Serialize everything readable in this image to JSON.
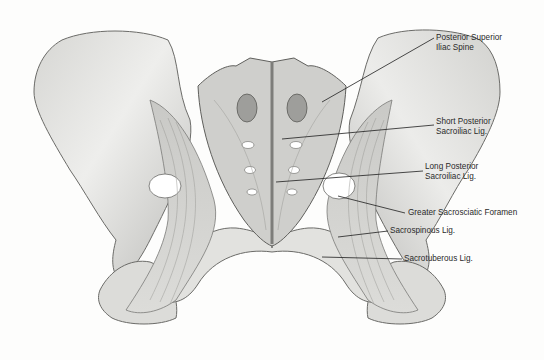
{
  "figure": {
    "colors": {
      "background": "#fdfdfc",
      "bone": "#e4e4e2",
      "bone_shadow": "#b9b9b6",
      "outline": "#6b6b68",
      "leader": "#1e1e1e",
      "label_text": "#2a2a2a"
    }
  },
  "labels": [
    {
      "id": "psis",
      "line1": "Posterior Superior",
      "line2": "Iliac Spine",
      "x": 436,
      "y": 33,
      "pointer": [
        [
          322,
          102
        ],
        [
          434,
          38
        ]
      ]
    },
    {
      "id": "short-posterior",
      "line1": "Short Posterior",
      "line2": "Sacroiliac Lig.",
      "x": 436,
      "y": 117,
      "pointer": [
        [
          282,
          139
        ],
        [
          434,
          125
        ]
      ]
    },
    {
      "id": "long-posterior",
      "line1": "Long Posterior",
      "line2": "Sacroiliac Lig.",
      "x": 425,
      "y": 162,
      "pointer": [
        [
          276,
          182
        ],
        [
          423,
          171
        ]
      ]
    },
    {
      "id": "greater-foramen",
      "line1": "Greater Sacrosciatic Foramen",
      "line2": "",
      "x": 408,
      "y": 198,
      "pointer": [
        [
          338,
          196
        ],
        [
          405,
          213
        ]
      ]
    },
    {
      "id": "sacrospinous",
      "line1": "Sacrospinous Lig.",
      "line2": "",
      "x": 390,
      "y": 225,
      "pointer": [
        [
          338,
          237
        ],
        [
          388,
          231
        ]
      ]
    },
    {
      "id": "sacrotuberous",
      "line1": "Sacrotuberous Lig.",
      "line2": "",
      "x": 404,
      "y": 254,
      "pointer": [
        [
          322,
          257
        ],
        [
          402,
          259
        ]
      ]
    }
  ]
}
